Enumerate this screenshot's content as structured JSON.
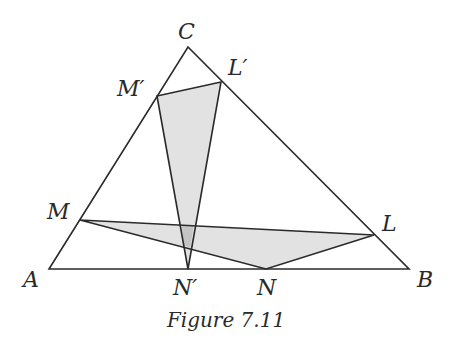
{
  "figure": {
    "caption": "Figure 7.11",
    "points": {
      "A": {
        "label": "A",
        "x": 49,
        "y": 269
      },
      "B": {
        "label": "B",
        "x": 409,
        "y": 269
      },
      "C": {
        "label": "C",
        "x": 188,
        "y": 47
      },
      "L": {
        "label": "L",
        "x": 374,
        "y": 235
      },
      "M": {
        "label": "M",
        "x": 80,
        "y": 220
      },
      "N": {
        "label": "N",
        "x": 266,
        "y": 269
      },
      "L_prime": {
        "label": "L′",
        "x": 221,
        "y": 82
      },
      "M_prime": {
        "label": "M′",
        "x": 157,
        "y": 96
      },
      "N_prime": {
        "label": "N′",
        "x": 188,
        "y": 269
      }
    },
    "triangles": [
      {
        "name": "ABC",
        "vertices": [
          "A",
          "B",
          "C"
        ],
        "shaded": false
      },
      {
        "name": "LMN",
        "vertices": [
          "L",
          "M",
          "N"
        ],
        "shaded": true
      },
      {
        "name": "L'M'N'",
        "vertices": [
          "L′",
          "M′",
          "N′"
        ],
        "shaded": true
      }
    ],
    "colors": {
      "line": "#2a2a2a",
      "shade": "#e2e2e2",
      "overlap": "#c4c4c4"
    }
  }
}
